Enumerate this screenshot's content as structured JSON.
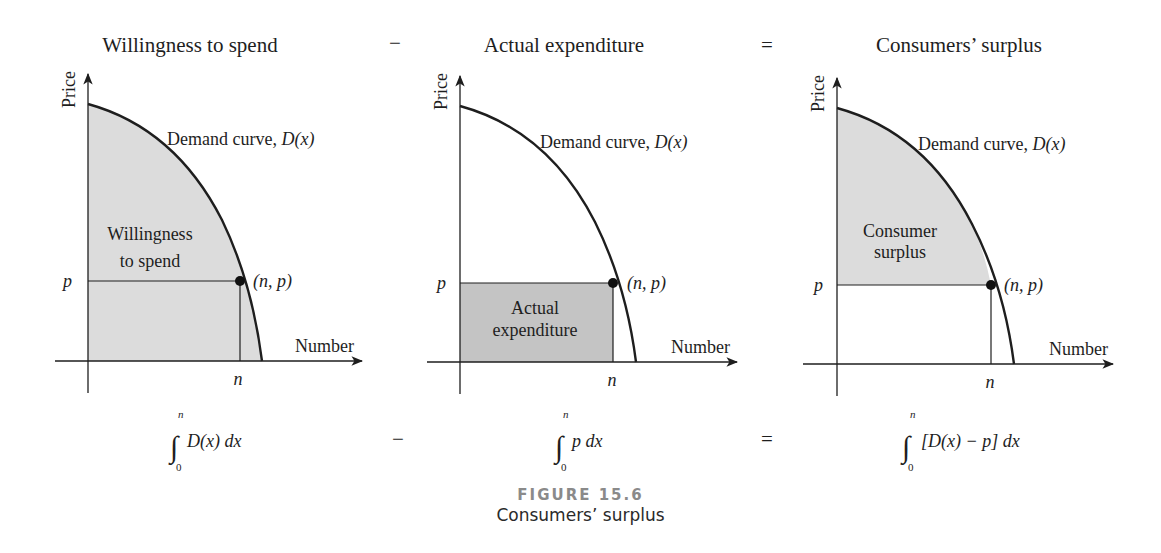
{
  "figure": {
    "number_label": "FIGURE 15.6",
    "caption": "Consumers’ surplus"
  },
  "operators": {
    "minus": "−",
    "equals": "="
  },
  "panels": [
    {
      "id": "willingness",
      "title": "Willingness to spend",
      "y_axis_label": "Price",
      "x_axis_label": "Number",
      "curve_label": "Demand curve, ",
      "curve_label_math": "D(x)",
      "region_label_line1": "Willingness",
      "region_label_line2": "to spend",
      "price_tick": "p",
      "quantity_tick": "n",
      "point_label": "(n, p)",
      "shaded_region": "area under demand curve from 0 to n",
      "fill_color": "#dcdcdc",
      "integral": {
        "upper": "n",
        "lower": "0",
        "integrand": "D(x) dx"
      }
    },
    {
      "id": "expenditure",
      "title": "Actual expenditure",
      "y_axis_label": "Price",
      "x_axis_label": "Number",
      "curve_label": "Demand curve, ",
      "curve_label_math": "D(x)",
      "region_label_line1": "Actual",
      "region_label_line2": "expenditure",
      "price_tick": "p",
      "quantity_tick": "n",
      "point_label": "(n, p)",
      "shaded_region": "rectangle 0..n by 0..p",
      "fill_color": "#c4c4c4",
      "integral": {
        "upper": "n",
        "lower": "0",
        "integrand": "p dx"
      }
    },
    {
      "id": "surplus",
      "title": "Consumers’ surplus",
      "y_axis_label": "Price",
      "x_axis_label": "Number",
      "curve_label": "Demand curve, ",
      "curve_label_math": "D(x)",
      "region_label_line1": "Consumer",
      "region_label_line2": "surplus",
      "price_tick": "p",
      "quantity_tick": "n",
      "point_label": "(n, p)",
      "shaded_region": "area between demand curve and price p from 0 to n",
      "fill_color": "#dcdcdc",
      "integral": {
        "upper": "n",
        "lower": "0",
        "integrand": "[D(x) − p] dx"
      }
    }
  ],
  "colors": {
    "line": "#1e1e1e",
    "light_fill": "#dcdcdc",
    "dark_fill": "#c4c4c4",
    "figure_label": "#8a8a8a"
  }
}
